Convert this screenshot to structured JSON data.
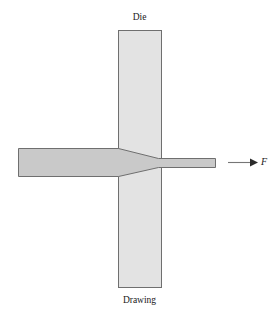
{
  "figure": {
    "title": "Drawing",
    "labels": {
      "die": "Die",
      "process": "Drawing",
      "force": "F"
    },
    "colors": {
      "background": "#ffffff",
      "die_fill": "#e3e3e3",
      "die_stroke": "#6f6f6f",
      "workpiece_fill": "#c9c9c9",
      "workpiece_stroke": "#6f6f6f",
      "arrow": "#767676",
      "text": "#1a1a1a"
    },
    "geometry": {
      "die": {
        "x": 118,
        "y": 30,
        "width": 44,
        "height": 258
      },
      "workpiece_entry": {
        "x": 18,
        "y": 148,
        "height": 28
      },
      "taper": {
        "start_x": 118,
        "end_x": 158
      },
      "workpiece_exit": {
        "x": 158,
        "y": 158,
        "width": 57,
        "height": 9
      },
      "arrow": {
        "x1": 228,
        "y1": 162,
        "x2": 256,
        "y2": 162
      }
    }
  }
}
